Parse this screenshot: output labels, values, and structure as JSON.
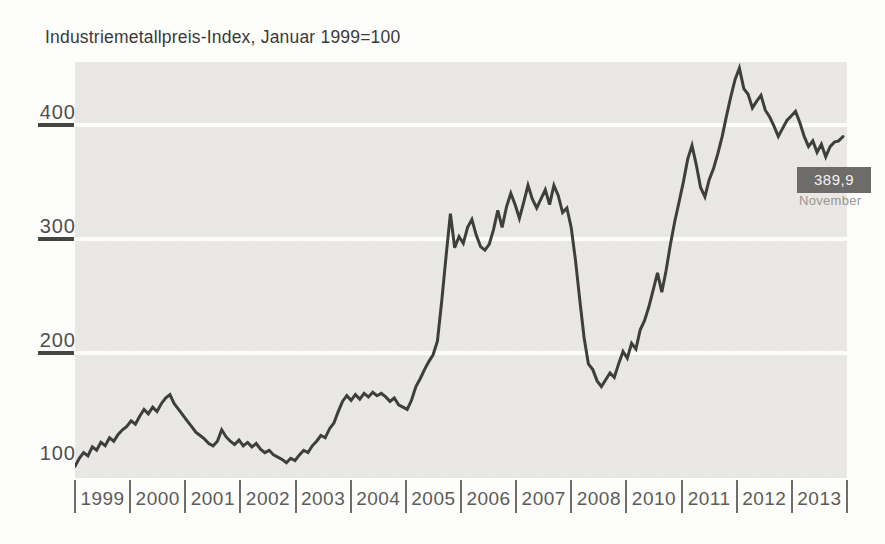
{
  "title": "Industriemetallpreis-Index, Januar 1999=100",
  "y_axis": {
    "labels": [
      "400",
      "300",
      "200",
      "100"
    ],
    "label_values": [
      400,
      300,
      200,
      100
    ],
    "tick_values": [
      400,
      300,
      200
    ],
    "grid_values": [
      400,
      300,
      200
    ]
  },
  "x_axis": {
    "labels": [
      "1999",
      "2000",
      "2001",
      "2002",
      "2003",
      "2004",
      "2005",
      "2006",
      "2007",
      "2008",
      "2010",
      "2011",
      "2012",
      "2013"
    ]
  },
  "annotation": {
    "value": "389,9",
    "sublabel": "November"
  },
  "colors": {
    "page_bg": "#fdfdfb",
    "plot_bg": "#e9e8e4",
    "line": "#3e3e3e",
    "grid": "#fcfcfa",
    "title_text": "#3a3a38",
    "y_axis_text": "#504f4d",
    "x_axis_text": "#5c5b58",
    "callout_bg": "#6d6c6a",
    "callout_text": "#f4f3f0",
    "callout_sub_text": "#9b968f"
  },
  "chart_data": {
    "type": "line",
    "title": "Industriemetallpreis-Index, Januar 1999=100",
    "xlabel": "",
    "ylabel": "Index (Januar 1999=100)",
    "ylim": [
      90,
      455
    ],
    "yticks": [
      100,
      200,
      300,
      400
    ],
    "gridlines_y": [
      200,
      300,
      400
    ],
    "grid": "on",
    "legend": "none",
    "x_start": "1999-01",
    "x_end": "2013-11",
    "frequency": "monthly",
    "x_year_labels": [
      "1999",
      "2000",
      "2001",
      "2002",
      "2003",
      "2004",
      "2005",
      "2006",
      "2007",
      "2008",
      "2010",
      "2011",
      "2012",
      "2013"
    ],
    "series": [
      {
        "name": "Industriemetallpreis-Index",
        "values": [
          100,
          107,
          112,
          109,
          117,
          114,
          121,
          118,
          125,
          122,
          128,
          132,
          135,
          140,
          137,
          144,
          150,
          146,
          152,
          148,
          155,
          160,
          163,
          155,
          150,
          145,
          140,
          135,
          130,
          127,
          124,
          120,
          118,
          122,
          132,
          126,
          122,
          119,
          123,
          118,
          121,
          117,
          120,
          115,
          112,
          114,
          110,
          108,
          106,
          103,
          107,
          105,
          110,
          114,
          112,
          118,
          122,
          127,
          125,
          133,
          138,
          148,
          157,
          162,
          158,
          163,
          159,
          164,
          161,
          165,
          162,
          164,
          161,
          157,
          160,
          154,
          152,
          150,
          158,
          170,
          177,
          185,
          192,
          198,
          210,
          245,
          285,
          322,
          292,
          302,
          296,
          310,
          317,
          303,
          293,
          290,
          295,
          308,
          325,
          310,
          328,
          340,
          330,
          318,
          332,
          347,
          335,
          327,
          335,
          343,
          330,
          347,
          338,
          323,
          327,
          310,
          281,
          246,
          213,
          190,
          185,
          175,
          170,
          176,
          182,
          178,
          190,
          201,
          195,
          208,
          203,
          220,
          228,
          240,
          255,
          270,
          253,
          272,
          295,
          315,
          332,
          350,
          370,
          382,
          365,
          345,
          337,
          352,
          362,
          375,
          390,
          408,
          425,
          440,
          450,
          432,
          427,
          415,
          421,
          426,
          413,
          407,
          399,
          390,
          397,
          404,
          408,
          412,
          402,
          390,
          381,
          386,
          376,
          383,
          372,
          381,
          385,
          386,
          389.9
        ]
      }
    ],
    "annotation": {
      "date": "2013-11",
      "value": 389.9,
      "label": "389,9",
      "sublabel": "November"
    }
  }
}
